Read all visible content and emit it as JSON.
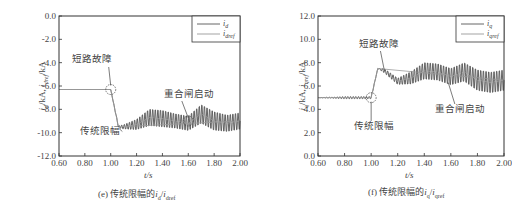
{
  "chart_data": [
    {
      "type": "line",
      "panel": "e",
      "caption": "(e) 传统限幅的i_d/i_dref",
      "caption_prefix": "(e) 传统限幅的",
      "caption_math": "i_d/i_dref",
      "xlabel": "t/s",
      "ylabel": "i_d/kA, i_dref/kA",
      "xlim": [
        0.6,
        2.0
      ],
      "ylim": [
        -12.0,
        0.0
      ],
      "xticks": [
        "0.60",
        "0.80",
        "1.00",
        "1.20",
        "1.40",
        "1.60",
        "1.80",
        "2.00"
      ],
      "yticks": [
        "0.0",
        "-2.0",
        "-4.0",
        "-6.0",
        "-8.0",
        "-10.0",
        "-12.0"
      ],
      "legend": [
        "i_d",
        "i_dref"
      ],
      "legend_position": "upper right",
      "annotations": [
        {
          "text": "短路故障",
          "x": 1.0,
          "y": -6.3
        },
        {
          "text": "传统限幅",
          "x": 1.08,
          "y": -9.6
        },
        {
          "text": "重合闸启动",
          "x": 1.6,
          "y": -9.0
        }
      ],
      "series": [
        {
          "name": "i_d",
          "x": [
            0.6,
            0.8,
            1.0,
            1.06,
            1.1,
            1.2,
            1.3,
            1.4,
            1.5,
            1.6,
            1.7,
            1.8,
            1.9,
            2.0
          ],
          "values": [
            -6.3,
            -6.3,
            -6.3,
            -9.5,
            -9.5,
            -9.3,
            -8.7,
            -8.8,
            -9.0,
            -9.2,
            -8.4,
            -9.0,
            -9.2,
            -9.0
          ],
          "oscillation_amplitude": [
            0,
            0,
            0,
            0.1,
            0.2,
            0.5,
            0.8,
            0.8,
            0.7,
            0.7,
            0.9,
            0.9,
            0.8,
            0.8
          ]
        },
        {
          "name": "i_dref",
          "x": [
            0.6,
            1.0,
            1.06,
            2.0
          ],
          "values": [
            -6.3,
            -6.3,
            -9.5,
            -9.0
          ]
        }
      ]
    },
    {
      "type": "line",
      "panel": "f",
      "caption": "(f) 传统限幅的i_q/i_qref",
      "caption_prefix": "(f) 传统限幅的",
      "caption_math": "i_q/i_qref",
      "xlabel": "t/s",
      "ylabel": "i_q/kA, i_qref/kA",
      "xlim": [
        0.6,
        2.0
      ],
      "ylim": [
        0.0,
        12.0
      ],
      "xticks": [
        "0.60",
        "0.80",
        "1.00",
        "1.20",
        "1.40",
        "1.60",
        "1.80",
        "2.00"
      ],
      "yticks": [
        "12.0",
        "10.0",
        "8.0",
        "6.0",
        "4.0",
        "2.0",
        "0.0"
      ],
      "legend": [
        "i_q",
        "i_qref"
      ],
      "legend_position": "upper right",
      "annotations": [
        {
          "text": "传统限幅",
          "x": 1.06,
          "y": 7.5
        },
        {
          "text": "短路故障",
          "x": 1.0,
          "y": 5.0
        },
        {
          "text": "重合闸启动",
          "x": 1.6,
          "y": 6.5
        }
      ],
      "series": [
        {
          "name": "i_q",
          "x": [
            0.6,
            0.8,
            1.0,
            1.05,
            1.1,
            1.2,
            1.3,
            1.4,
            1.5,
            1.6,
            1.7,
            1.8,
            1.9,
            2.0
          ],
          "values": [
            5.0,
            5.0,
            5.0,
            7.5,
            7.3,
            6.4,
            6.7,
            7.3,
            7.2,
            6.8,
            7.2,
            6.5,
            6.3,
            6.5
          ],
          "oscillation_amplitude": [
            0,
            0.1,
            0.1,
            0,
            0.2,
            0.3,
            0.6,
            0.8,
            0.8,
            0.8,
            0.9,
            1.0,
            1.0,
            1.0
          ]
        },
        {
          "name": "i_qref",
          "x": [
            0.6,
            1.0,
            1.05,
            2.0
          ],
          "values": [
            5.0,
            5.0,
            7.5,
            6.5
          ]
        }
      ]
    }
  ]
}
